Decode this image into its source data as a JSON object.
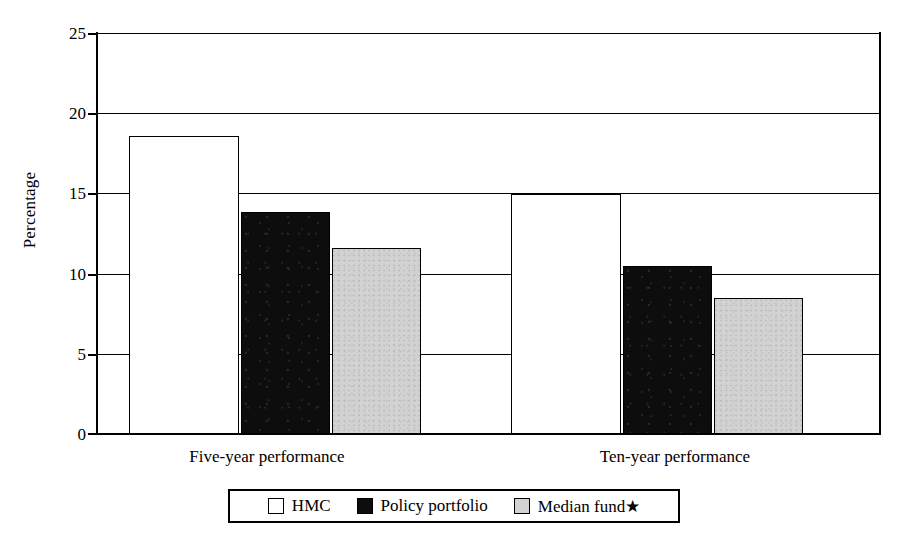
{
  "chart_data": {
    "type": "bar",
    "title": "",
    "subtitle": "",
    "xlabel": "",
    "ylabel": "Percentage",
    "ylim": [
      0,
      25
    ],
    "yticks": [
      0,
      5,
      10,
      15,
      20,
      25
    ],
    "ytick_labels": [
      "0",
      "5",
      "10",
      "15",
      "20",
      "25"
    ],
    "grid": true,
    "grid_axis": "y",
    "legend_position": "bottom",
    "categories": [
      "Five-year performance",
      "Ten-year performance"
    ],
    "series": [
      {
        "name": "HMC",
        "color": "#ffffff",
        "values": [
          18.6,
          15.0
        ]
      },
      {
        "name": "Policy portfolio",
        "color": "#0d0d0d",
        "values": [
          13.9,
          10.5
        ]
      },
      {
        "name": "Median fund★",
        "color": "#d2d2d2",
        "values": [
          11.6,
          8.5
        ]
      }
    ],
    "annotations": []
  },
  "axes": {
    "y_title": "Percentage",
    "y_ticks": [
      {
        "value": 25,
        "label": "25"
      },
      {
        "value": 20,
        "label": "20"
      },
      {
        "value": 15,
        "label": "15"
      },
      {
        "value": 10,
        "label": "10"
      },
      {
        "value": 5,
        "label": "5"
      },
      {
        "value": 0,
        "label": "0"
      }
    ],
    "x_categories": [
      {
        "label": "Five-year performance"
      },
      {
        "label": "Ten-year performance"
      }
    ]
  },
  "legend": {
    "entries": [
      {
        "label": "HMC",
        "swatch": "white-square-icon"
      },
      {
        "label": "Policy portfolio",
        "swatch": "black-square-icon"
      },
      {
        "label": "Median fund★",
        "swatch": "gray-square-icon"
      }
    ]
  },
  "bars": [
    {
      "group": 0,
      "series": "HMC",
      "value": 18.6,
      "x": 32,
      "w": 110
    },
    {
      "group": 0,
      "series": "Policy portfolio",
      "value": 13.9,
      "x": 144,
      "w": 89
    },
    {
      "group": 0,
      "series": "Median fund",
      "value": 11.6,
      "x": 235,
      "w": 89
    },
    {
      "group": 1,
      "series": "HMC",
      "value": 15.0,
      "x": 414,
      "w": 110
    },
    {
      "group": 1,
      "series": "Policy portfolio",
      "value": 10.5,
      "x": 526,
      "w": 89
    },
    {
      "group": 1,
      "series": "Median fund",
      "value": 8.5,
      "x": 617,
      "w": 89
    }
  ]
}
